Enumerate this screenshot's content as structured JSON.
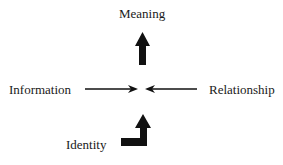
{
  "diagram": {
    "nodes": {
      "top": {
        "label": "Meaning"
      },
      "left": {
        "label": "Information"
      },
      "right": {
        "label": "Relationship"
      },
      "bottom": {
        "label": "Identity"
      }
    },
    "edges": [
      {
        "from": "Information",
        "to": "center",
        "style": "thin-arrow"
      },
      {
        "from": "Relationship",
        "to": "center",
        "style": "thin-arrow"
      },
      {
        "from": "center",
        "to": "Meaning",
        "style": "bold-arrow"
      },
      {
        "from": "Identity",
        "to": "center",
        "style": "bold-bent-arrow"
      }
    ],
    "colors": {
      "ink": "#111111",
      "background": "#ffffff"
    }
  }
}
